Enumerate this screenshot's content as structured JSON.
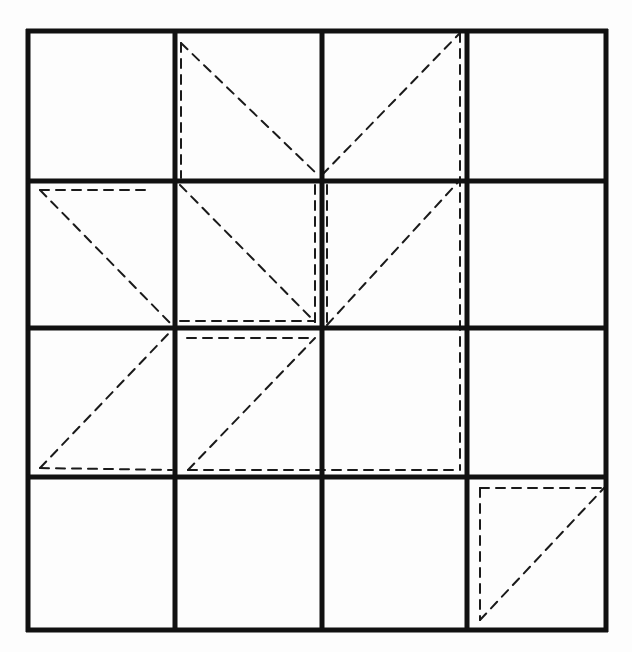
{
  "diagram": {
    "type": "grid-with-dashed-triangles",
    "rows": 4,
    "cols": 4,
    "grid_color": "#111111",
    "dash_color": "#1a1a1a",
    "grid_x": [
      28,
      175,
      322,
      467,
      606
    ],
    "grid_y": [
      31,
      181,
      328,
      477,
      630
    ],
    "dashed_segments": [
      [
        181,
        43,
        181,
        178
      ],
      [
        181,
        43,
        318,
        175
      ],
      [
        322,
        175,
        460,
        33
      ],
      [
        460,
        33,
        460,
        470
      ],
      [
        40,
        190,
        152,
        190
      ],
      [
        40,
        190,
        172,
        325
      ],
      [
        180,
        185,
        315,
        322
      ],
      [
        315,
        185,
        315,
        322
      ],
      [
        180,
        321,
        315,
        321
      ],
      [
        327,
        185,
        327,
        325
      ],
      [
        327,
        325,
        460,
        180
      ],
      [
        40,
        468,
        172,
        330
      ],
      [
        40,
        468,
        172,
        470
      ],
      [
        187,
        338,
        315,
        338
      ],
      [
        188,
        470,
        315,
        338
      ],
      [
        188,
        470,
        460,
        470
      ],
      [
        480,
        488,
        604,
        488
      ],
      [
        480,
        488,
        480,
        620
      ],
      [
        480,
        620,
        604,
        488
      ]
    ]
  }
}
